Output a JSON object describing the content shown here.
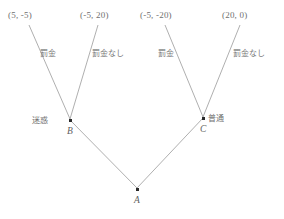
{
  "diagram": {
    "type": "extensive-form-game-tree",
    "background_color": "#ffffff",
    "line_color": "#9a9a9a",
    "text_color": "#6d6d6d",
    "nodes": [
      {
        "id": "A",
        "label": "A",
        "type_label": "",
        "x": 137,
        "y": 189
      },
      {
        "id": "B",
        "label": "B",
        "type_label": "迷惑",
        "x": 70,
        "y": 120
      },
      {
        "id": "C",
        "label": "C",
        "type_label": "普通",
        "x": 203,
        "y": 118
      }
    ],
    "payoffs": [
      {
        "id": "p1",
        "text": "(5, -5)",
        "x": 8,
        "y": 10
      },
      {
        "id": "p2",
        "text": "(-5, 20)",
        "x": 80,
        "y": 10
      },
      {
        "id": "p3",
        "text": "(-5, -20)",
        "x": 140,
        "y": 10
      },
      {
        "id": "p4",
        "text": "(20, 0)",
        "x": 222,
        "y": 10
      }
    ],
    "edges": [
      {
        "id": "e1",
        "from": "B",
        "to": "p1",
        "label": "罰金",
        "label_x": 40,
        "label_y": 47
      },
      {
        "id": "e2",
        "from": "B",
        "to": "p2",
        "label": "罰金なし",
        "label_x": 92,
        "label_y": 47
      },
      {
        "id": "e3",
        "from": "C",
        "to": "p3",
        "label": "罰金",
        "label_x": 158,
        "label_y": 47
      },
      {
        "id": "e4",
        "from": "C",
        "to": "p4",
        "label": "罰金なし",
        "label_x": 233,
        "label_y": 47
      },
      {
        "id": "e5",
        "from": "A",
        "to": "B",
        "label": "",
        "label_x": 0,
        "label_y": 0
      },
      {
        "id": "e6",
        "from": "A",
        "to": "C",
        "label": "",
        "label_x": 0,
        "label_y": 0
      }
    ]
  }
}
